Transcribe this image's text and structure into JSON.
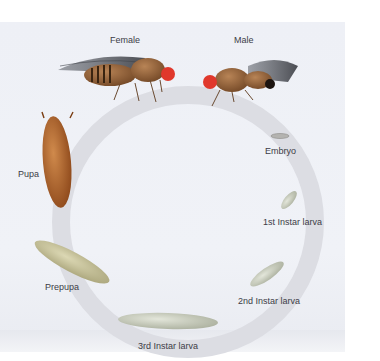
{
  "stages": [
    {
      "id": "female",
      "label": "Female"
    },
    {
      "id": "male",
      "label": "Male"
    },
    {
      "id": "embryo",
      "label": "Embryo"
    },
    {
      "id": "first-instar",
      "label": "1st Instar larva"
    },
    {
      "id": "second-instar",
      "label": "2nd Instar larva"
    },
    {
      "id": "third-instar",
      "label": "3rd Instar larva"
    },
    {
      "id": "prepupa",
      "label": "Prepupa"
    },
    {
      "id": "pupa",
      "label": "Pupa"
    }
  ],
  "colors": {
    "background": "#eef0f6",
    "ring": "#dcdde3",
    "label_text": "#3c3c46",
    "fly_body": "#8a5a2e",
    "fly_eye": "#e0382c",
    "pupa": "#b0632a",
    "prepupa": "#c9c49a",
    "larva": "#c7cdbb"
  }
}
